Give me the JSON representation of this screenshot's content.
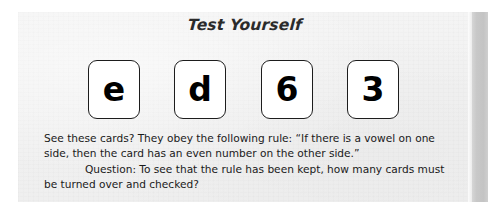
{
  "page": {
    "background_color": "#ffffff",
    "panel_color": "#f1f1f1",
    "gutter_color": "#c6c6c6",
    "text_color": "#1a1a1a"
  },
  "header": {
    "title": "Test Yourself"
  },
  "cards": [
    {
      "glyph": "e",
      "kind": "letter"
    },
    {
      "glyph": "d",
      "kind": "letter"
    },
    {
      "glyph": "6",
      "kind": "number"
    },
    {
      "glyph": "3",
      "kind": "number"
    }
  ],
  "body": {
    "paragraph_rule": "See these cards? They obey the following rule: “If there is a vowel on one side, then the card has an even number on the other side.”",
    "paragraph_question": "Question: To see that the rule has been kept, how many cards must be turned over and checked?"
  }
}
